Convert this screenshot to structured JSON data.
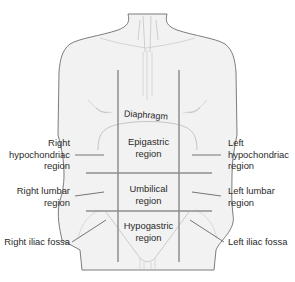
{
  "diagram": {
    "labels": {
      "diaphragm": "Diaphragm",
      "right_hypochondriac": [
        "Right",
        "hypochondriac",
        "region"
      ],
      "epigastric": [
        "Epigastric",
        "region"
      ],
      "left_hypochondriac": [
        "Left",
        "hypochondriac",
        "region"
      ],
      "right_lumbar": [
        "Right lumbar",
        "region"
      ],
      "umbilical": [
        "Umbilical",
        "region"
      ],
      "left_lumbar": [
        "Left lumbar",
        "region"
      ],
      "right_iliac": "Right iliac fossa",
      "hypogastric": [
        "Hypogastric",
        "region"
      ],
      "left_iliac": "Left iliac fossa"
    },
    "colors": {
      "body_fill": "#f1f1f1",
      "body_outline": "#6e6e6e",
      "grid_lines": "#8a8a8a",
      "leader_lines": "#555555",
      "text": "#2a2a2a"
    }
  }
}
